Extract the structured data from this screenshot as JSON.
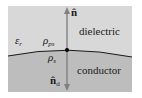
{
  "diagram": {
    "regions": {
      "dielectric": {
        "label": "dielectric",
        "color": "#d8d8d8"
      },
      "conductor": {
        "label": "conductor",
        "color": "#bdbdbd"
      }
    },
    "symbols": {
      "permittivity": {
        "base": "ε",
        "sub": "r"
      },
      "polarization_charge": {
        "base": "ρ",
        "sub": "ps"
      },
      "surface_charge": {
        "base": "ρ",
        "sub": "s"
      },
      "normal_up": {
        "base": "n̂",
        "sub": ""
      },
      "normal_down": {
        "base": "n̂",
        "sub": "d"
      }
    },
    "colors": {
      "arrow": "#808080",
      "boundary": "#1a1a1a",
      "text": "#1a1a1a"
    }
  }
}
